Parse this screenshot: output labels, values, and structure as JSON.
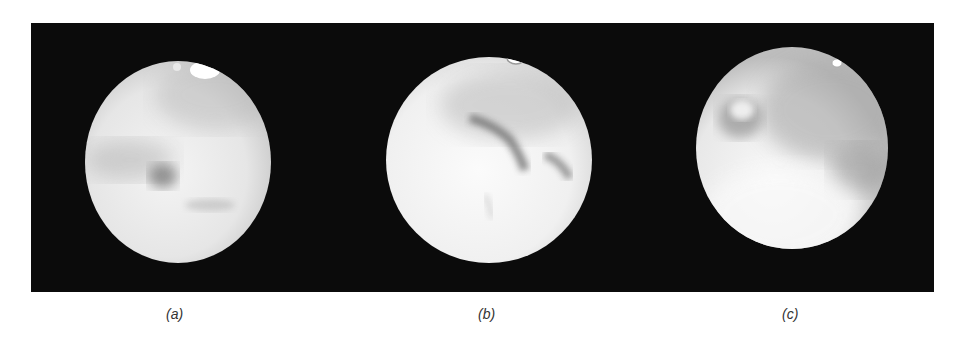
{
  "figure": {
    "background": "#0b0b0b",
    "panels": [
      {
        "id": "a",
        "label": "(a)",
        "letter": "a",
        "cx": 178,
        "cy": 162,
        "r": 93,
        "features": [
          "north polar cap (bright, top right)",
          "dark central spot",
          "greyish equatorial markings"
        ]
      },
      {
        "id": "b",
        "label": "(b)",
        "letter": "b",
        "cx": 489,
        "cy": 160,
        "r": 103,
        "features": [
          "small polar cap at top",
          "dark curved markings across middle",
          "grey northern hemisphere"
        ]
      },
      {
        "id": "c",
        "label": "(c)",
        "letter": "c",
        "cx": 792,
        "cy": 148,
        "r": 96,
        "features": [
          "small bright polar cap top right",
          "dark ring-shaped marking upper left",
          "grey band across right side"
        ]
      }
    ]
  }
}
